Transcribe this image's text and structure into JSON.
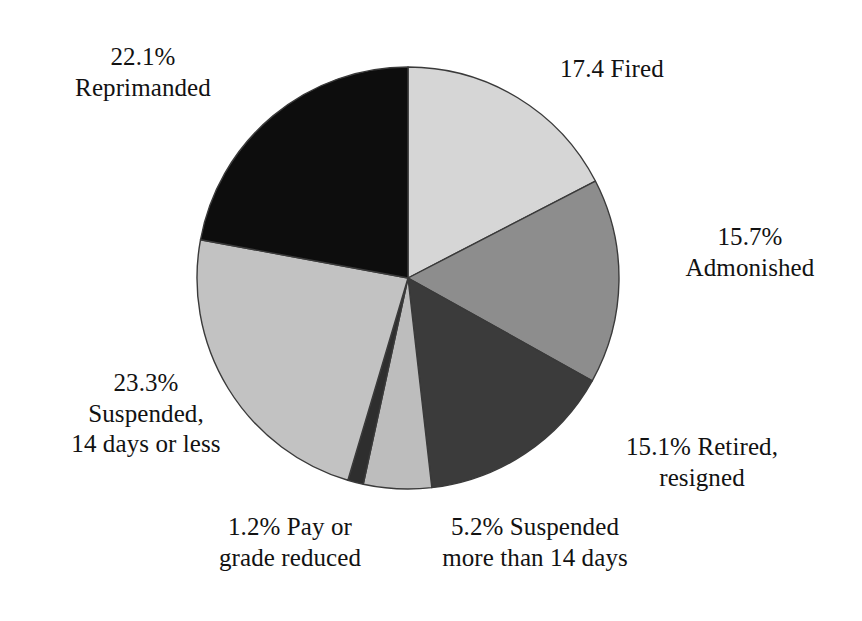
{
  "chart_data": {
    "type": "pie",
    "title": "",
    "subtitle": "",
    "xlabel": "",
    "ylabel": "",
    "legend_position": "none",
    "grid": false,
    "units": "percent",
    "start_angle_deg": 0,
    "direction": "clockwise",
    "center": {
      "x": 408,
      "y": 278
    },
    "radius": 211,
    "categories": [
      "Fired",
      "Admonished",
      "Retired, resigned",
      "Suspended more than 14 days",
      "Pay or grade reduced",
      "Suspended, 14 days or less",
      "Reprimanded"
    ],
    "values": [
      17.4,
      15.7,
      15.1,
      5.2,
      1.2,
      23.3,
      22.1
    ],
    "slices": [
      {
        "name": "fired",
        "value": 17.4,
        "value_text": "17.4",
        "label": "Fired",
        "label_lines": [
          "17.4 Fired"
        ],
        "color": "#d6d6d6"
      },
      {
        "name": "admonished",
        "value": 15.7,
        "value_text": "15.7%",
        "label": "Admonished",
        "label_lines": [
          "15.7%",
          "Admonished"
        ],
        "color": "#8d8d8d"
      },
      {
        "name": "retired-resigned",
        "value": 15.1,
        "value_text": "15.1%",
        "label": "Retired, resigned",
        "label_lines": [
          "15.1% Retired,",
          "resigned"
        ],
        "color": "#3b3b3b"
      },
      {
        "name": "suspended-more-than-14-days",
        "value": 5.2,
        "value_text": "5.2%",
        "label": "Suspended more than 14 days",
        "label_lines": [
          "5.2% Suspended",
          "more than 14 days"
        ],
        "color": "#bdbdbd"
      },
      {
        "name": "pay-or-grade-reduced",
        "value": 1.2,
        "value_text": "1.2%",
        "label": "Pay or grade reduced",
        "label_lines": [
          "1.2% Pay or",
          "grade reduced"
        ],
        "color": "#2e2e2e"
      },
      {
        "name": "suspended-14-days-or-less",
        "value": 23.3,
        "value_text": "23.3%",
        "label": "Suspended, 14 days or less",
        "label_lines": [
          "23.3%",
          "Suspended,",
          "14 days or less"
        ],
        "color": "#c2c2c2"
      },
      {
        "name": "reprimanded",
        "value": 22.1,
        "value_text": "22.1%",
        "label": "Reprimanded",
        "label_lines": [
          "22.1%",
          "Reprimanded"
        ],
        "color": "#0d0d0d"
      }
    ],
    "total": 100.0,
    "stroke_color": "#3a3a3a",
    "background": "#ffffff"
  },
  "labels": {
    "reprimanded": "22.1%\nReprimanded",
    "fired": "17.4 Fired",
    "admonished": "15.7%\nAdmonished",
    "retired": "15.1% Retired,\nresigned",
    "suspended_more": "5.2% Suspended\nmore than 14 days",
    "pay_grade": "1.2% Pay or\ngrade reduced",
    "suspended_less": "23.3%\nSuspended,\n14 days or less"
  }
}
